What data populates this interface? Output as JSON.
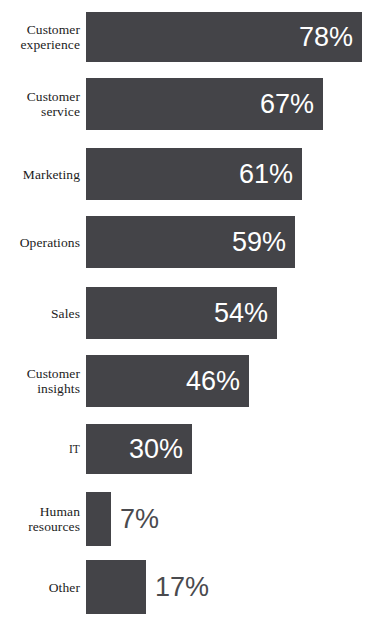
{
  "chart_data": {
    "type": "bar",
    "orientation": "horizontal",
    "title": "",
    "subtitle": "",
    "xlabel": "",
    "ylabel": "",
    "xlim": [
      0,
      100
    ],
    "grid": false,
    "legend": null,
    "value_suffix": "%",
    "categories": [
      "Customer experience",
      "Customer service",
      "Marketing",
      "Operations",
      "Sales",
      "Customer insights",
      "IT",
      "Human resources",
      "Other"
    ],
    "values": [
      78,
      67,
      61,
      59,
      54,
      46,
      30,
      7,
      17
    ],
    "value_labels": [
      "78%",
      "67%",
      "61%",
      "59%",
      "54%",
      "46%",
      "30%",
      "7%",
      "17%"
    ],
    "colors": {
      "bar": "#444448",
      "value_inside": "#ffffff",
      "value_outside": "#4a4a4e",
      "label": "#1c1c1c",
      "background": "#ffffff"
    }
  },
  "rows": [
    {
      "label_line1": "Customer",
      "label_line2": "experience",
      "value_label": "78%",
      "value": 78,
      "label_inside": true,
      "label_size": "normal"
    },
    {
      "label_line1": "Customer",
      "label_line2": "service",
      "value_label": "67%",
      "value": 67,
      "label_inside": true,
      "label_size": "normal"
    },
    {
      "label_line1": "Marketing",
      "label_line2": "",
      "value_label": "61%",
      "value": 61,
      "label_inside": true,
      "label_size": "normal"
    },
    {
      "label_line1": "Operations",
      "label_line2": "",
      "value_label": "59%",
      "value": 59,
      "label_inside": true,
      "label_size": "normal"
    },
    {
      "label_line1": "Sales",
      "label_line2": "",
      "value_label": "54%",
      "value": 54,
      "label_inside": true,
      "label_size": "normal"
    },
    {
      "label_line1": "Customer",
      "label_line2": "insights",
      "value_label": "46%",
      "value": 46,
      "label_inside": true,
      "label_size": "normal"
    },
    {
      "label_line1": "IT",
      "label_line2": "",
      "value_label": "30%",
      "value": 30,
      "label_inside": true,
      "label_size": "small"
    },
    {
      "label_line1": "Human",
      "label_line2": "resources",
      "value_label": "7%",
      "value": 7,
      "label_inside": false,
      "label_size": "normal"
    },
    {
      "label_line1": "Other",
      "label_line2": "",
      "value_label": "17%",
      "value": 17,
      "label_inside": false,
      "label_size": "normal"
    }
  ],
  "geometry": {
    "bar_origin_x": 86,
    "px_per_percent": 3.54,
    "min_bar_px": 8,
    "row_tops": [
      12,
      78,
      148,
      216,
      287,
      355,
      424,
      492,
      560
    ],
    "row_heights": [
      50,
      52,
      52,
      52,
      52,
      52,
      50,
      54,
      54
    ]
  }
}
